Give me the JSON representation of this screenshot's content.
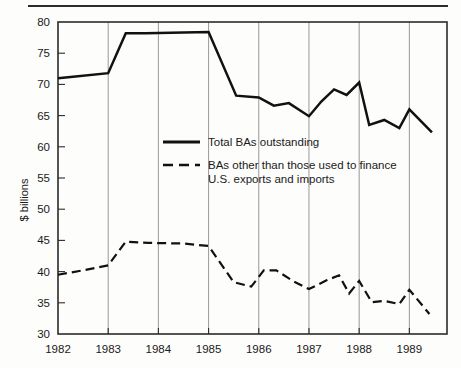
{
  "chart_data": {
    "type": "line",
    "title": "",
    "xlabel": "",
    "ylabel": "$ billions",
    "ylim": [
      30,
      80
    ],
    "xlim": [
      1982.0,
      1989.75
    ],
    "yticks": [
      30,
      35,
      40,
      45,
      50,
      55,
      60,
      65,
      70,
      75,
      80
    ],
    "ytick_labels": [
      "30",
      "35",
      "40",
      "45",
      "50",
      "55",
      "60",
      "65",
      "70",
      "75",
      "80"
    ],
    "xticks": [
      1982,
      1983,
      1984,
      1985,
      1986,
      1987,
      1988,
      1989
    ],
    "xtick_labels": [
      "1982",
      "1983",
      "1984",
      "1985",
      "1986",
      "1987",
      "1988",
      "1989"
    ],
    "grid": "vertical-only",
    "legend_position": "center",
    "series": [
      {
        "name": "Total BAs outstanding",
        "style": "solid",
        "x": [
          1982.0,
          1982.25,
          1983.0,
          1983.35,
          1983.75,
          1984.5,
          1985.0,
          1985.55,
          1986.0,
          1986.3,
          1986.6,
          1987.0,
          1987.25,
          1987.5,
          1987.75,
          1988.0,
          1988.2,
          1988.5,
          1988.8,
          1989.0,
          1989.45
        ],
        "values": [
          71.0,
          71.2,
          71.8,
          78.2,
          78.2,
          78.3,
          78.4,
          68.2,
          67.9,
          66.6,
          67.0,
          64.9,
          67.3,
          69.2,
          68.3,
          70.3,
          63.5,
          64.3,
          63.0,
          66.0,
          62.3
        ]
      },
      {
        "name": "BAs other than those used to finance U.S. exports and imports",
        "style": "dashed",
        "x": [
          1982.0,
          1982.5,
          1983.0,
          1983.35,
          1983.8,
          1984.5,
          1985.0,
          1985.5,
          1985.85,
          1986.1,
          1986.35,
          1986.7,
          1987.0,
          1987.35,
          1987.6,
          1987.8,
          1988.0,
          1988.25,
          1988.5,
          1988.8,
          1989.0,
          1989.4
        ],
        "values": [
          39.5,
          40.2,
          41.0,
          44.8,
          44.6,
          44.5,
          44.1,
          38.3,
          37.6,
          40.2,
          40.2,
          38.4,
          37.2,
          38.6,
          39.4,
          36.5,
          38.5,
          35.1,
          35.3,
          34.8,
          37.1,
          33.2
        ]
      }
    ]
  },
  "legend": {
    "entries": [
      {
        "label": "Total BAs outstanding",
        "style": "solid"
      },
      {
        "label": "BAs other than those used to finance",
        "style": "dashed"
      },
      {
        "label": "U.S. exports and imports",
        "style": "continuation"
      }
    ]
  },
  "colors": {
    "line": "#111111",
    "frame": "#2b2b2b",
    "grid": "#8d8d8d",
    "background": "#fdfdfc",
    "text": "#1a1a1a"
  }
}
